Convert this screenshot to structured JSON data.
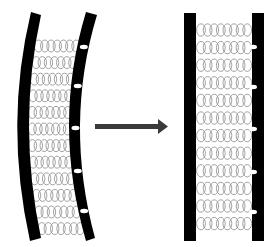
{
  "diagram": {
    "colors": {
      "background": "#ffffff",
      "wall": "#000000",
      "coil": "#8a8a8a",
      "arrow": "#3a3a3a",
      "notch": "#ffffff"
    },
    "left_panel": {
      "state": "curved",
      "coil_rows": 12,
      "coils_per_row": 7,
      "notch_count": 5
    },
    "arrow": {
      "direction": "right",
      "icon": "arrow-right-icon"
    },
    "right_panel": {
      "state": "straight",
      "coil_rows": 12,
      "coils_per_row": 8,
      "notch_count": 5
    }
  }
}
